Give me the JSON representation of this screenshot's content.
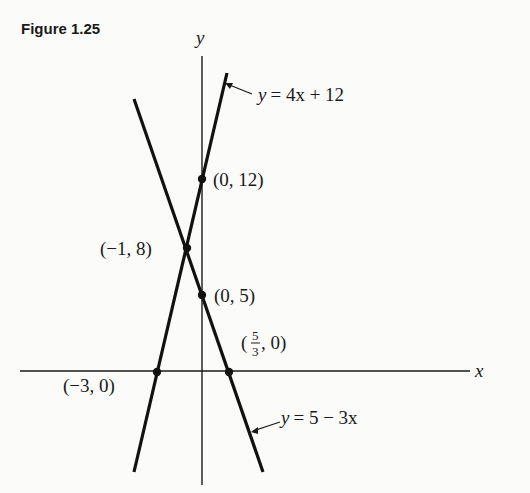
{
  "figure": {
    "title": "Figure 1.25",
    "axes": {
      "x_label": "x",
      "y_label": "y"
    },
    "lines": [
      {
        "label": "y = 4x + 12",
        "lhs": "y",
        "rhs": "= 4x + 12",
        "slope": 4,
        "intercept": 12
      },
      {
        "label": "y = 5 − 3x",
        "lhs": "y",
        "rhs": "= 5 − 3x",
        "slope": -3,
        "intercept": 5
      }
    ],
    "points": [
      {
        "label": "(0, 12)",
        "x": 0,
        "y": 12
      },
      {
        "label": "(−1, 8)",
        "x": -1,
        "y": 8
      },
      {
        "label": "(0, 5)",
        "x": 0,
        "y": 5
      },
      {
        "label": "(−3, 0)",
        "x": -3,
        "y": 0
      },
      {
        "label_prefix": "(",
        "label_num": "5",
        "label_den": "3",
        "label_suffix": ", 0)",
        "x": 1.6667,
        "y": 0
      }
    ]
  }
}
